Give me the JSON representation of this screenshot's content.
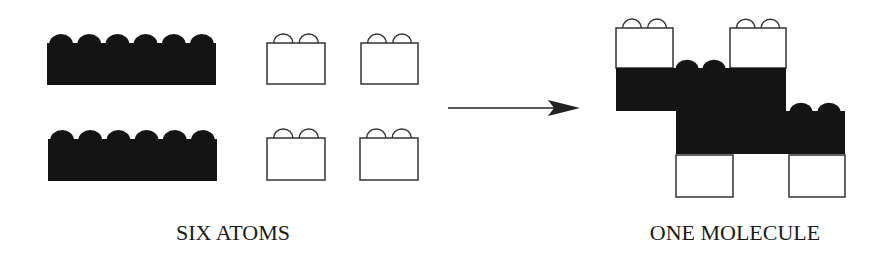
{
  "diagram": {
    "left_label": "SIX ATOMS",
    "right_label": "ONE MOLECULE",
    "colors": {
      "black_block": "#141414",
      "white_block_fill": "#ffffff",
      "outline": "#333333",
      "arrow": "#222222"
    },
    "atoms": {
      "black_bricks": [
        {
          "x": 47,
          "y": 43,
          "w": 169,
          "h": 42,
          "studs": 6
        },
        {
          "x": 48,
          "y": 139,
          "w": 169,
          "h": 42,
          "studs": 6
        }
      ],
      "white_bricks": [
        {
          "x": 267,
          "y": 43,
          "w": 58,
          "h": 41,
          "studs": 2
        },
        {
          "x": 361,
          "y": 43,
          "w": 57,
          "h": 41,
          "studs": 2
        },
        {
          "x": 267,
          "y": 138,
          "w": 58,
          "h": 42,
          "studs": 2
        },
        {
          "x": 360,
          "y": 138,
          "w": 58,
          "h": 42,
          "studs": 2
        }
      ]
    },
    "arrow": {
      "x1": 448,
      "y": 108,
      "x2": 580
    },
    "molecule": {
      "black_bricks": [
        {
          "x": 616,
          "y": 68,
          "w": 170,
          "h": 43
        },
        {
          "x": 676,
          "y": 111,
          "w": 169,
          "h": 43
        }
      ],
      "visible_black_studs": [
        {
          "cx": 687,
          "cy": 68
        },
        {
          "cx": 714,
          "cy": 68
        },
        {
          "cx": 801,
          "cy": 111
        },
        {
          "cx": 829,
          "cy": 111
        }
      ],
      "white_bricks": [
        {
          "x": 616,
          "y": 28,
          "w": 57,
          "h": 40,
          "studs": 2
        },
        {
          "x": 730,
          "y": 28,
          "w": 56,
          "h": 40,
          "studs": 2
        },
        {
          "x": 676,
          "y": 155,
          "w": 57,
          "h": 42,
          "studs": 0
        },
        {
          "x": 789,
          "y": 155,
          "w": 56,
          "h": 42,
          "studs": 0
        }
      ]
    }
  }
}
